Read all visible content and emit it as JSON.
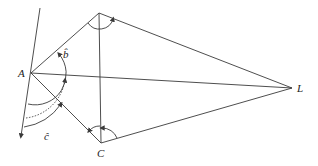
{
  "diagram": {
    "type": "geometry-kite",
    "points": {
      "A": {
        "label": "A",
        "x": 31,
        "y": 73
      },
      "B": {
        "label": "",
        "x": 99,
        "y": 13
      },
      "C": {
        "label": "C",
        "x": 101,
        "y": 143
      },
      "L": {
        "label": "L",
        "x": 292,
        "y": 88
      }
    },
    "angle_labels": {
      "b": "b̂",
      "c": "ĉ"
    },
    "edges": [
      "A-B",
      "B-L",
      "A-L",
      "A-C",
      "C-L",
      "B-C"
    ],
    "axis_line": {
      "from": [
        40,
        8
      ],
      "to": [
        21,
        138
      ],
      "arrow": "end"
    },
    "stroke_color": "#3a3a3a"
  }
}
